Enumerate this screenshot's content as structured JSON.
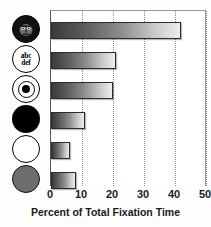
{
  "chart_data": {
    "type": "bar",
    "orientation": "horizontal",
    "title": "",
    "xlabel": "Percent of Total Fixation Time",
    "ylabel": "",
    "xlim": [
      0,
      50
    ],
    "xticks": [
      0,
      10,
      20,
      30,
      40,
      50
    ],
    "xtick_labels": [
      "0",
      "10",
      "20",
      "30",
      "40",
      "50"
    ],
    "grid": "vertical-dotted",
    "legend": "none",
    "categories": [
      "face-stimulus",
      "abc-def-text",
      "bullseye-target",
      "black-circle",
      "white-circle",
      "gray-circle"
    ],
    "category_icons": [
      "face-icon",
      "text-abc-def-icon",
      "bullseye-icon",
      "black-circle-icon",
      "white-circle-icon",
      "gray-circle-icon"
    ],
    "values": [
      42,
      21,
      20,
      11,
      6,
      8
    ],
    "bar_fill": "gradient-dark-to-light",
    "bar_color_dark": "#3a3a3a",
    "bar_color_light": "#ededed",
    "bar_border": "#2c2c2c",
    "gridline_color": "#8a8a8a",
    "axis_color": "#555555",
    "background": "#ffffff"
  },
  "icons": {
    "text_line1": "abc",
    "text_line2": "def"
  }
}
